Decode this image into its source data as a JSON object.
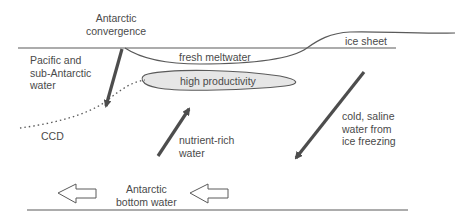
{
  "diagram": {
    "type": "ocean cross-section schematic",
    "colors": {
      "line": "#5a5a5a",
      "arrow": "#4d4d4d",
      "productivity_fill": "#e6e6e6",
      "text": "#4a4a4a"
    },
    "labels": {
      "antarctic_convergence": "Antarctic\nconvergence",
      "pacific_water": "Pacific and\nsub-Antarctic\nwater",
      "fresh_meltwater": "fresh meltwater",
      "ice_sheet": "ice sheet",
      "high_productivity": "high productivity",
      "ccd": "CCD",
      "nutrient_rich_water": "nutrient-rich\nwater",
      "cold_saline_water": "cold, saline\nwater from\nice freezing",
      "antarctic_bottom_water": "Antarctic\nbottom water"
    },
    "arrows": [
      {
        "name": "convergence-sinking",
        "direction": "down-left",
        "style": "solid"
      },
      {
        "name": "nutrient-upwelling",
        "direction": "up-right",
        "style": "solid"
      },
      {
        "name": "cold-saline-sinking",
        "direction": "down-left",
        "style": "solid"
      },
      {
        "name": "bottom-water-flow-1",
        "direction": "left",
        "style": "hollow"
      },
      {
        "name": "bottom-water-flow-2",
        "direction": "left",
        "style": "hollow"
      }
    ]
  }
}
